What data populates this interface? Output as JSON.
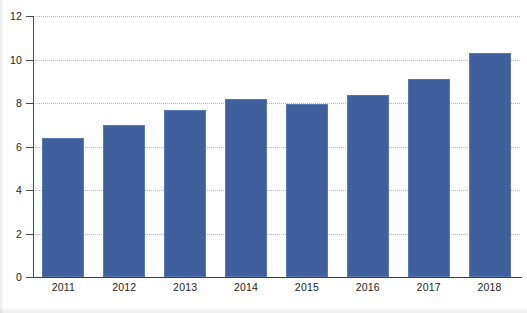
{
  "chart_data": {
    "type": "bar",
    "title": "",
    "subtitle": "",
    "xlabel": "",
    "ylabel": "",
    "categories": [
      "2011",
      "2012",
      "2013",
      "2014",
      "2015",
      "2016",
      "2017",
      "2018"
    ],
    "values": [
      6.4,
      7.0,
      7.7,
      8.2,
      7.95,
      8.35,
      9.1,
      10.3
    ],
    "series": [
      {
        "name": "",
        "values": [
          6.4,
          7.0,
          7.7,
          8.2,
          7.95,
          8.35,
          9.1,
          10.3
        ],
        "color": "#3f5f9d"
      }
    ],
    "ylim": [
      0,
      12
    ],
    "ytick_values": [
      0,
      2,
      4,
      6,
      8,
      10,
      12
    ],
    "ytick_labels": [
      "0",
      "2",
      "4",
      "6",
      "8",
      "10",
      "12"
    ],
    "xtick_labels": [
      "2011",
      "2012",
      "2013",
      "2014",
      "2015",
      "2016",
      "2017",
      "2018"
    ],
    "grid": true,
    "grid_style": "dotted-horizontal",
    "legend": false,
    "legend_position": "none",
    "annotations": []
  },
  "style": {
    "bar_color": "#3f5f9d",
    "bar_edge_color": "#5878b3",
    "grid_color": "#b9b9b9",
    "axis_color": "#4a4a4a",
    "text_color": "#1d1d1d",
    "background": "#fefefe"
  }
}
